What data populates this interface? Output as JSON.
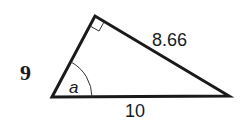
{
  "diagram": {
    "type": "right-triangle",
    "vertices": {
      "left": [
        52,
        97
      ],
      "top": [
        95,
        16
      ],
      "right": [
        229,
        96
      ]
    },
    "right_angle_at": "top",
    "labels": {
      "left_side": "9",
      "hypotenuse_side": "8.66",
      "base": "10",
      "angle": "a"
    },
    "colors": {
      "stroke": "#1a1a1a",
      "background": "#ffffff"
    }
  }
}
